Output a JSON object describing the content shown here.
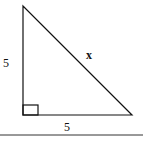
{
  "diagram": {
    "type": "right-triangle",
    "labels": {
      "left_leg": "5",
      "bottom_leg": "5",
      "hypotenuse": "x"
    },
    "right_angle_marker": true,
    "baseline": true,
    "colors": {
      "stroke": "#111111",
      "background": "#ffffff"
    }
  }
}
